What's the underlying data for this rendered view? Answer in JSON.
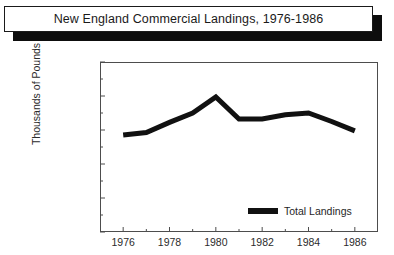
{
  "title": "New England Commercial Landings, 1976-1986",
  "legend": {
    "series_label": "Total Landings",
    "swatch_color": "#111111"
  },
  "axes": {
    "ylabel": "Thousands of Pounds",
    "xlabel": "",
    "yticks": [
      "0",
      "200000",
      "400000",
      "600000",
      "800000",
      "1000000"
    ],
    "xticks": [
      "1976",
      "1978",
      "1980",
      "1982",
      "1984",
      "1986"
    ]
  },
  "chart_data": {
    "type": "line",
    "title": "New England Commercial Landings, 1976-1986",
    "xlabel": "",
    "ylabel": "Thousands of Pounds",
    "x": [
      1976,
      1977,
      1978,
      1979,
      1980,
      1981,
      1982,
      1983,
      1984,
      1985,
      1986
    ],
    "series": [
      {
        "name": "Total Landings",
        "color": "#111111",
        "values": [
          570000,
          585000,
          645000,
          700000,
          795000,
          665000,
          665000,
          690000,
          700000,
          650000,
          595000
        ]
      }
    ],
    "xlim": [
      1975,
      1987
    ],
    "ylim": [
      0,
      1000000
    ],
    "ytick_values": [
      0,
      200000,
      400000,
      600000,
      800000,
      1000000
    ],
    "xtick_values": [
      1976,
      1978,
      1980,
      1982,
      1984,
      1986
    ],
    "minor_ticks": true,
    "grid": false,
    "legend_position": "lower right"
  }
}
